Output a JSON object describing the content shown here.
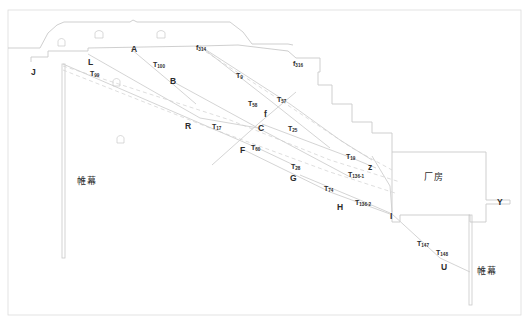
{
  "figure": {
    "type": "engineering-cross-section",
    "colors": {
      "outline": "#c9c9c9",
      "fault_line": "#cfcfcf",
      "dashed_line": "#d5d5d5",
      "frame": "#dcdcdc",
      "text": "#2b2b2b",
      "background": "#ffffff"
    }
  },
  "frame": {
    "x": 8,
    "y": 10,
    "width": 513,
    "height": 305
  },
  "point_labels": [
    {
      "id": "J",
      "text": "J",
      "x": 31,
      "y": 68
    },
    {
      "id": "L",
      "text": "L",
      "x": 88,
      "y": 58
    },
    {
      "id": "A",
      "text": "A",
      "x": 131,
      "y": 45
    },
    {
      "id": "B",
      "text": "B",
      "x": 170,
      "y": 77
    },
    {
      "id": "R",
      "text": "R",
      "x": 185,
      "y": 122
    },
    {
      "id": "C",
      "text": "C",
      "x": 258,
      "y": 124
    },
    {
      "id": "f",
      "text": "f",
      "x": 264,
      "y": 110
    },
    {
      "id": "F",
      "text": "F",
      "x": 240,
      "y": 146
    },
    {
      "id": "G",
      "text": "G",
      "x": 290,
      "y": 174
    },
    {
      "id": "Z",
      "text": "z",
      "x": 368,
      "y": 163
    },
    {
      "id": "H",
      "text": "H",
      "x": 337,
      "y": 203
    },
    {
      "id": "I",
      "text": "I",
      "x": 390,
      "y": 212
    },
    {
      "id": "U",
      "text": "U",
      "x": 441,
      "y": 263
    },
    {
      "id": "Y",
      "text": "Y",
      "x": 497,
      "y": 198
    }
  ],
  "fault_labels": [
    {
      "id": "T99",
      "base": "T",
      "sub": "99",
      "x": 90,
      "y": 70
    },
    {
      "id": "T100",
      "base": "T",
      "sub": "100",
      "x": 153,
      "y": 61
    },
    {
      "id": "T9",
      "base": "T",
      "sub": "9",
      "x": 236,
      "y": 72
    },
    {
      "id": "T58",
      "base": "T",
      "sub": "58",
      "x": 248,
      "y": 100
    },
    {
      "id": "T57",
      "base": "T",
      "sub": "57",
      "x": 277,
      "y": 96
    },
    {
      "id": "T17",
      "base": "T",
      "sub": "17",
      "x": 212,
      "y": 123
    },
    {
      "id": "T25",
      "base": "T",
      "sub": "25",
      "x": 288,
      "y": 125
    },
    {
      "id": "T60",
      "base": "T",
      "sub": "60",
      "x": 251,
      "y": 144
    },
    {
      "id": "T19",
      "base": "T",
      "sub": "19",
      "x": 346,
      "y": 153
    },
    {
      "id": "T28",
      "base": "T",
      "sub": "28",
      "x": 291,
      "y": 163
    },
    {
      "id": "T136-1",
      "base": "T",
      "sub": "136-1",
      "x": 348,
      "y": 171
    },
    {
      "id": "T74",
      "base": "T",
      "sub": "74",
      "x": 324,
      "y": 185
    },
    {
      "id": "T136-2",
      "base": "T",
      "sub": "136-2",
      "x": 355,
      "y": 199
    },
    {
      "id": "T147",
      "base": "T",
      "sub": "147",
      "x": 417,
      "y": 240
    },
    {
      "id": "T148",
      "base": "T",
      "sub": "148",
      "x": 436,
      "y": 249
    }
  ],
  "f_labels": [
    {
      "id": "f314",
      "base": "f",
      "sub": "314",
      "x": 196,
      "y": 44
    },
    {
      "id": "f316",
      "base": "f",
      "sub": "316",
      "x": 293,
      "y": 60
    }
  ],
  "cn_labels": [
    {
      "id": "curtain-left",
      "text": "帷幕",
      "x": 77,
      "y": 177
    },
    {
      "id": "powerhouse",
      "text": "厂房",
      "x": 424,
      "y": 173
    },
    {
      "id": "curtain-right",
      "text": "帷幕",
      "x": 477,
      "y": 267
    }
  ],
  "geometry": {
    "terrain_outline": "M 8,48 L 40,48 L 48,33 L 57,25 L 64,22 L 130,22 L 133,20 L 137,22 L 230,22 L 243,32 L 252,44 L 288,44 L 293,45",
    "bench_profile": "M 31,62 L 31,57 L 48,57 L 48,51 L 88,51 L 88,48 L 200,46 L 238,45 L 288,51 L 296,58 L 320,58 L 320,72 L 318,72 L 318,85 L 332,85 L 332,104 L 352,104 L 352,122 L 372,122 L 372,133 L 392,133 L 392,152",
    "powerhouse_outline": "M 392,152 L 486,152 L 486,200 L 510,200 L 510,204 L 486,204 L 486,222 L 470,222 L 470,215 L 400,215 L 400,222 L 392,222 Z",
    "curtain_left": {
      "x": 62,
      "y1": 64,
      "y2": 258,
      "width": 3
    },
    "curtain_right": {
      "x": 469,
      "y1": 215,
      "y2": 305,
      "width": 3
    },
    "faults": [
      {
        "id": "T99",
        "path": "M 63,64 L 262,150 L 300,168"
      },
      {
        "id": "T100",
        "path": "M 131,49 L 175,86 L 196,104"
      },
      {
        "id": "T9",
        "path": "M 200,46 L 290,104 L 340,140 L 372,160"
      },
      {
        "id": "T57",
        "path": "M 200,46 L 272,102 L 330,148"
      },
      {
        "id": "T58",
        "path": "M 170,80 L 258,128 L 352,178"
      },
      {
        "id": "T17",
        "path": "M 88,54 L 200,118 L 258,128"
      },
      {
        "id": "T60",
        "path": "M 212,165 L 258,124 L 296,92"
      },
      {
        "id": "T25",
        "path": "M 262,124 L 352,158 L 376,168"
      },
      {
        "id": "T28",
        "path": "M 240,148 L 330,192 L 390,214"
      },
      {
        "id": "T136-1",
        "path": "M 372,156 L 390,186 L 392,212"
      },
      {
        "id": "T147",
        "path": "M 392,214 L 440,258 L 470,272"
      },
      {
        "id": "T74",
        "path": "M 300,175 L 360,200 L 390,213"
      }
    ],
    "dashed": [
      {
        "id": "d1",
        "path": "M 63,66 L 230,120 L 330,160 L 400,182"
      },
      {
        "id": "d2",
        "path": "M 63,70 L 210,128 L 330,172 L 395,193"
      },
      {
        "id": "d3",
        "path": "M 200,48 L 280,100 L 352,148 L 392,170"
      }
    ],
    "galleries": [
      {
        "id": "g1",
        "x": 58,
        "y": 38,
        "w": 7,
        "h": 8
      },
      {
        "id": "g2",
        "x": 95,
        "y": 30,
        "w": 8,
        "h": 8
      },
      {
        "id": "g3",
        "x": 157,
        "y": 30,
        "w": 8,
        "h": 8
      },
      {
        "id": "g4",
        "x": 113,
        "y": 78,
        "w": 7,
        "h": 8
      },
      {
        "id": "g5",
        "x": 117,
        "y": 135,
        "w": 7,
        "h": 8
      }
    ]
  }
}
